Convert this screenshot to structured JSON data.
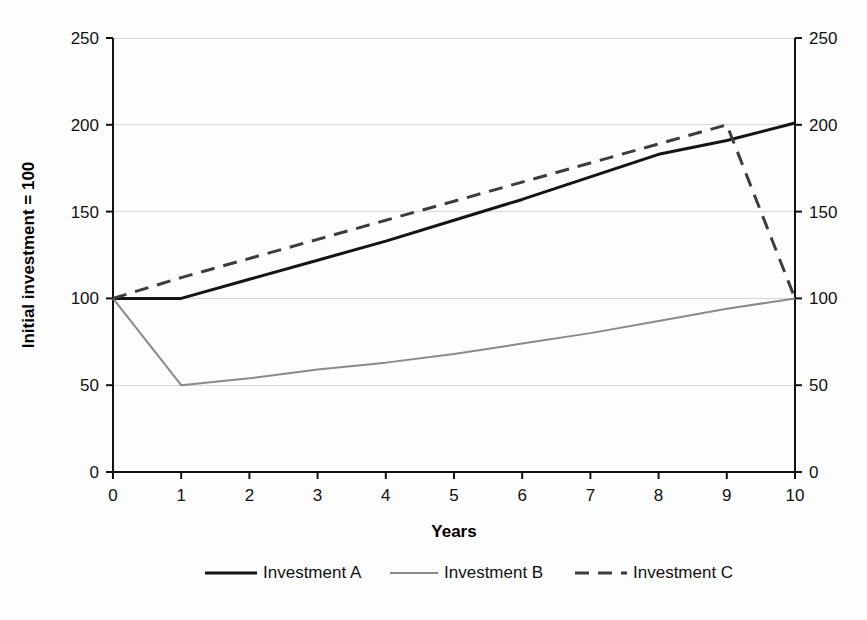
{
  "chart_data": {
    "type": "line",
    "title": "",
    "xlabel": "Years",
    "ylabel": "Initial investment = 100",
    "xlim": [
      0,
      10
    ],
    "ylim": [
      0,
      250
    ],
    "grid": true,
    "legend_position": "bottom",
    "x": [
      0,
      1,
      2,
      3,
      4,
      5,
      6,
      7,
      8,
      9,
      10
    ],
    "xtick_labels": [
      "0",
      "1",
      "2",
      "3",
      "4",
      "5",
      "6",
      "7",
      "8",
      "9",
      "10"
    ],
    "ytick_labels": [
      "0",
      "50",
      "100",
      "150",
      "200",
      "250"
    ],
    "ytick_values": [
      0,
      50,
      100,
      150,
      200,
      250
    ],
    "right_axis": {
      "visible": true,
      "ytick_labels": [
        "0",
        "50",
        "100",
        "150",
        "200",
        "250"
      ],
      "ytick_values": [
        0,
        50,
        100,
        150,
        200,
        250
      ]
    },
    "series": [
      {
        "name": "Investment A",
        "style": "solid",
        "color": "#141414",
        "values": [
          100,
          100,
          111,
          122,
          133,
          145,
          157,
          170,
          183,
          191,
          201
        ]
      },
      {
        "name": "Investment B",
        "style": "solid-thin",
        "color": "#8a8a8a",
        "values": [
          100,
          50,
          54,
          59,
          63,
          68,
          74,
          80,
          87,
          94,
          100
        ]
      },
      {
        "name": "Investment C",
        "style": "dashed",
        "color": "#3d3d3d",
        "values": [
          100,
          112,
          123,
          134,
          145,
          156,
          167,
          178,
          189,
          200,
          100
        ]
      }
    ]
  },
  "legend": {
    "items": [
      {
        "label": "Investment A"
      },
      {
        "label": "Investment B"
      },
      {
        "label": "Investment C"
      }
    ]
  }
}
